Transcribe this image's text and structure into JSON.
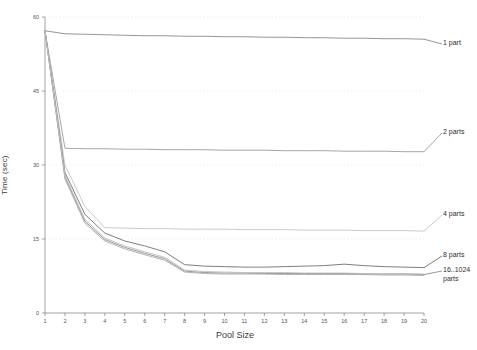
{
  "chart_data": {
    "type": "line",
    "title": "",
    "xlabel": "Pool Size",
    "ylabel": "Time (sec)",
    "xlim": [
      1,
      20
    ],
    "ylim": [
      0,
      60
    ],
    "xticks": [
      1,
      2,
      3,
      4,
      5,
      6,
      7,
      8,
      9,
      10,
      11,
      12,
      13,
      14,
      15,
      16,
      17,
      18,
      19,
      20
    ],
    "xtick_labels": [
      "1",
      "2",
      "3",
      "4",
      "5",
      "6",
      "7",
      "8",
      "9",
      "10",
      "11",
      "12",
      "13",
      "14",
      "15",
      "16",
      "17",
      "18",
      "19",
      "20"
    ],
    "yticks": [
      0,
      15,
      30,
      45,
      60
    ],
    "ytick_labels": [
      "0",
      "15",
      "30",
      "45",
      "60"
    ],
    "grid": "horizontal-dotted-faint",
    "legend_position": "right-inline-labels",
    "x": [
      1,
      2,
      3,
      4,
      5,
      6,
      7,
      8,
      9,
      10,
      11,
      12,
      13,
      14,
      15,
      16,
      17,
      18,
      19,
      20
    ],
    "series": [
      {
        "name": "1 part",
        "label": "1 part",
        "color": "#8a8a8a",
        "label_y": 47,
        "values": [
          57.2,
          56.6,
          56.5,
          56.4,
          56.3,
          56.2,
          56.2,
          56.1,
          56.1,
          56.0,
          56.0,
          55.9,
          55.9,
          55.8,
          55.8,
          55.7,
          55.7,
          55.6,
          55.6,
          55.5
        ]
      },
      {
        "name": "2 parts",
        "label": "2 parts",
        "color": "#9d9d9d",
        "label_y": 136,
        "values": [
          57.2,
          33.4,
          33.3,
          33.3,
          33.2,
          33.2,
          33.1,
          33.1,
          33.1,
          33.0,
          33.0,
          33.0,
          32.9,
          32.9,
          32.9,
          32.8,
          32.8,
          32.8,
          32.7,
          32.7
        ]
      },
      {
        "name": "4 parts",
        "label": "4 parts",
        "color": "#c4c4c4",
        "label_y": 218,
        "values": [
          57.2,
          30.0,
          21.6,
          17.3,
          17.2,
          17.1,
          17.1,
          17.0,
          17.0,
          17.0,
          16.9,
          16.9,
          16.9,
          16.8,
          16.8,
          16.8,
          16.7,
          16.7,
          16.7,
          16.6
        ]
      },
      {
        "name": "8 parts",
        "label": "8 parts",
        "color": "#6f6f6f",
        "label_y": 259,
        "values": [
          57.2,
          28.5,
          20.0,
          16.2,
          14.6,
          13.6,
          12.4,
          9.8,
          9.5,
          9.4,
          9.3,
          9.3,
          9.4,
          9.5,
          9.6,
          9.9,
          9.6,
          9.4,
          9.3,
          9.2
        ]
      },
      {
        "name": "16..1024 parts",
        "label": "16..1024\nparts",
        "color": "#8e8e8e",
        "label_y": 274,
        "values": [
          57.2,
          27.6,
          18.6,
          14.9,
          13.3,
          12.1,
          11.0,
          8.5,
          8.2,
          8.1,
          8.1,
          8.0,
          8.0,
          8.0,
          8.0,
          8.0,
          7.9,
          7.9,
          7.9,
          7.8
        ]
      },
      {
        "name": "16..1024 parts (band b)",
        "label": "",
        "color": "#a8a8a8",
        "label_y": null,
        "values": [
          57.2,
          27.2,
          18.2,
          14.6,
          13.0,
          11.8,
          10.7,
          8.3,
          8.0,
          7.9,
          7.9,
          7.9,
          7.8,
          7.8,
          7.8,
          7.8,
          7.8,
          7.7,
          7.7,
          7.6
        ]
      },
      {
        "name": "16..1024 parts (band c)",
        "label": "",
        "color": "#bdbdbd",
        "label_y": null,
        "values": [
          57.2,
          27.9,
          19.0,
          15.2,
          13.6,
          12.4,
          11.3,
          8.7,
          8.4,
          8.3,
          8.2,
          8.2,
          8.2,
          8.1,
          8.1,
          8.1,
          8.0,
          8.0,
          8.0,
          7.9
        ]
      }
    ]
  },
  "axis": {
    "axis_color": "#8a8a8a",
    "grid_color": "#e6e6e6",
    "tick_text_color": "#555555"
  }
}
